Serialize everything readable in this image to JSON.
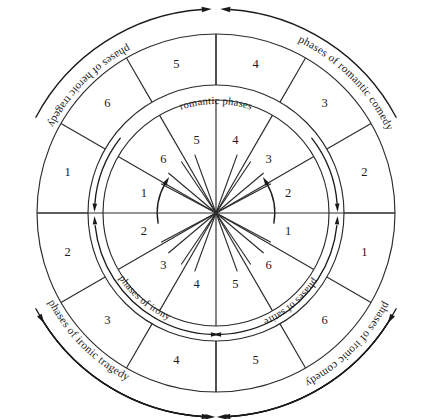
{
  "figure": {
    "type": "concentric-wheel-diagram",
    "title": "romantic phases",
    "background_color": "#ffffff",
    "line_color": "#2b2b2b",
    "text_color": "#1a1a1a"
  },
  "center_label": "romantic phases",
  "rings": {
    "outer": {
      "name": "outer-ring",
      "sector_count": 12,
      "numbers": [
        "1",
        "6",
        "5",
        "4",
        "3",
        "2",
        "1",
        "6",
        "5",
        "4",
        "3",
        "2"
      ],
      "quadrant_labels": [
        "phases of romantic comedy",
        "phases of ironic comedy",
        "phases of ironic tragedy",
        "phases of heroic tragedy"
      ]
    },
    "inner": {
      "name": "inner-ring",
      "sector_count": 12,
      "numbers": [
        "1",
        "6",
        "5",
        "4",
        "3",
        "2",
        "1",
        "6",
        "5",
        "4",
        "3",
        "2"
      ],
      "quadrant_labels": [
        "romantic phases",
        "phases of satire",
        "phases of irony"
      ]
    }
  },
  "outer_sectors": [
    {
      "label": "1",
      "angle_deg": -75
    },
    {
      "label": "6",
      "angle_deg": -45
    },
    {
      "label": "5",
      "angle_deg": -15
    },
    {
      "label": "4",
      "angle_deg": 15
    },
    {
      "label": "3",
      "angle_deg": 45
    },
    {
      "label": "2",
      "angle_deg": 75
    },
    {
      "label": "1",
      "angle_deg": 105
    },
    {
      "label": "6",
      "angle_deg": 135
    },
    {
      "label": "5",
      "angle_deg": 165
    },
    {
      "label": "4",
      "angle_deg": 195
    },
    {
      "label": "3",
      "angle_deg": 225
    },
    {
      "label": "2",
      "angle_deg": 255
    }
  ],
  "inner_sectors": [
    {
      "label": "1",
      "angle_deg": -75
    },
    {
      "label": "6",
      "angle_deg": -45
    },
    {
      "label": "5",
      "angle_deg": -15
    },
    {
      "label": "4",
      "angle_deg": 15
    },
    {
      "label": "3",
      "angle_deg": 45
    },
    {
      "label": "2",
      "angle_deg": 75
    },
    {
      "label": "1",
      "angle_deg": 105
    },
    {
      "label": "6",
      "angle_deg": 135
    },
    {
      "label": "5",
      "angle_deg": 165
    },
    {
      "label": "4",
      "angle_deg": 195
    },
    {
      "label": "3",
      "angle_deg": 225
    },
    {
      "label": "2",
      "angle_deg": 255
    }
  ],
  "outer_labels": {
    "romantic_comedy": "phases of romantic comedy",
    "ironic_comedy": "phases of ironic comedy",
    "ironic_tragedy": "phases of ironic tragedy",
    "heroic_tragedy": "phases of heroic tragedy"
  },
  "inner_labels": {
    "satire": "phases of satire",
    "irony": "phases of irony"
  },
  "geometry": {
    "center_x": 216,
    "center_y": 213,
    "outer_radius": 179,
    "mid_radius": 128,
    "inner_radius": 113,
    "arrow_radius": 204
  }
}
